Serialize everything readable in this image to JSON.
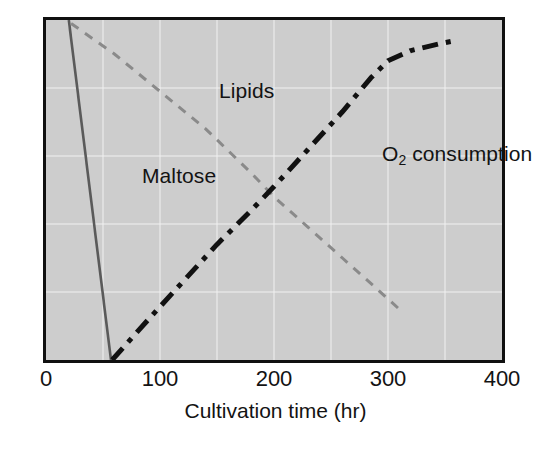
{
  "figure": {
    "background_color": "#ffffff",
    "plot_background_color": "#cdcdcd",
    "frame_color": "#101010",
    "gridline_color": "#f2f2f2"
  },
  "axis": {
    "x_title": "Cultivation time (hr)",
    "x_ticks": [
      "0",
      "100",
      "200",
      "300",
      "400"
    ],
    "y_title": "",
    "y_ticks": []
  },
  "series_labels": {
    "maltose": "Maltose",
    "lipids": "Lipids",
    "o2_main": "O",
    "o2_sub": "2",
    "o2_rest": " consumption"
  },
  "chart_data": {
    "type": "line",
    "title": "",
    "xlabel": "Cultivation time (hr)",
    "ylabel": "",
    "xlim": [
      0,
      400
    ],
    "ylim": [
      0,
      100
    ],
    "x_ticks": [
      0,
      100,
      200,
      300,
      400
    ],
    "y_ticks": [],
    "grid": true,
    "grid_x_interval": 50,
    "grid_y_divisions": 5,
    "legend": "inline-annotations",
    "legend_position": "in-plot",
    "series": [
      {
        "name": "Maltose",
        "color": "#5a5a5a",
        "style": "solid",
        "width": 2.6,
        "label_position": {
          "x": 46,
          "y": 63
        },
        "points": [
          {
            "x": 20,
            "y": 100
          },
          {
            "x": 57,
            "y": 0
          }
        ]
      },
      {
        "name": "Lipids",
        "color": "#8a8a8a",
        "style": "dashed",
        "width": 3.0,
        "label_position": {
          "x": 113,
          "y": 88
        },
        "points": [
          {
            "x": 22,
            "y": 99
          },
          {
            "x": 60,
            "y": 90
          },
          {
            "x": 100,
            "y": 79
          },
          {
            "x": 140,
            "y": 68
          },
          {
            "x": 180,
            "y": 55
          },
          {
            "x": 200,
            "y": 48
          },
          {
            "x": 230,
            "y": 39
          },
          {
            "x": 260,
            "y": 30
          },
          {
            "x": 290,
            "y": 21
          },
          {
            "x": 313,
            "y": 14
          }
        ]
      },
      {
        "name": "O2 consumption",
        "color": "#111111",
        "style": "dash-dot",
        "width": 5.0,
        "label_position": {
          "x": 256,
          "y": 70
        },
        "points": [
          {
            "x": 58,
            "y": 0
          },
          {
            "x": 90,
            "y": 12
          },
          {
            "x": 120,
            "y": 23
          },
          {
            "x": 150,
            "y": 34
          },
          {
            "x": 180,
            "y": 44
          },
          {
            "x": 200,
            "y": 51
          },
          {
            "x": 230,
            "y": 62
          },
          {
            "x": 260,
            "y": 73
          },
          {
            "x": 285,
            "y": 83
          },
          {
            "x": 300,
            "y": 88
          },
          {
            "x": 320,
            "y": 91
          },
          {
            "x": 345,
            "y": 93
          },
          {
            "x": 360,
            "y": 94
          }
        ]
      }
    ]
  }
}
